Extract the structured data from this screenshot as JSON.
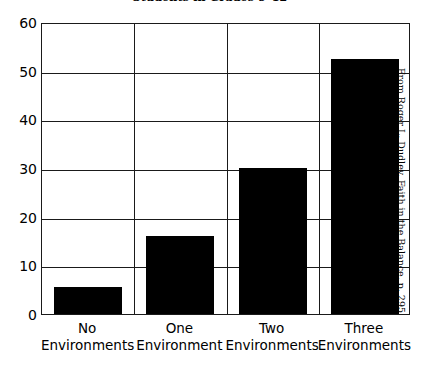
{
  "chart_data": {
    "type": "bar",
    "title": "Students in Grades 9–12",
    "xlabel": "",
    "ylabel": "",
    "ylim": [
      0,
      60
    ],
    "yticks": [
      0,
      10,
      20,
      30,
      40,
      50,
      60
    ],
    "grid": true,
    "legend": false,
    "categories": [
      "No Environments",
      "One Environment",
      "Two Environments",
      "Three Environments"
    ],
    "category_lines": [
      {
        "line1": "No",
        "line2": "Environments"
      },
      {
        "line1": "One",
        "line2": "Environment"
      },
      {
        "line1": "Two",
        "line2": "Environments"
      },
      {
        "line1": "Three",
        "line2": "Environments"
      }
    ],
    "values": [
      5.5,
      16,
      30,
      52.5
    ],
    "bar_color": "#000000",
    "axis_color": "#1a1a1a",
    "background": "#ffffff"
  },
  "attribution": {
    "text": "From Roger L. Dudley, Faith in the Balance, p. 295"
  }
}
